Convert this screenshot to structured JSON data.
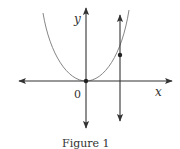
{
  "figure": {
    "caption": "Figure 1",
    "axes": {
      "x_label": "x",
      "y_label": "y",
      "origin_label": "0"
    },
    "elements": [
      {
        "type": "curve",
        "description": "upward-opening curve with vertex at origin"
      },
      {
        "type": "vertical-line",
        "description": "vertical line with arrows at both ends, right of y-axis"
      },
      {
        "type": "point",
        "description": "intersection of curve and vertical line"
      },
      {
        "type": "point",
        "description": "origin"
      }
    ],
    "colors": {
      "stroke": "#333333",
      "curve": "#777777",
      "background": "#ffffff"
    }
  }
}
